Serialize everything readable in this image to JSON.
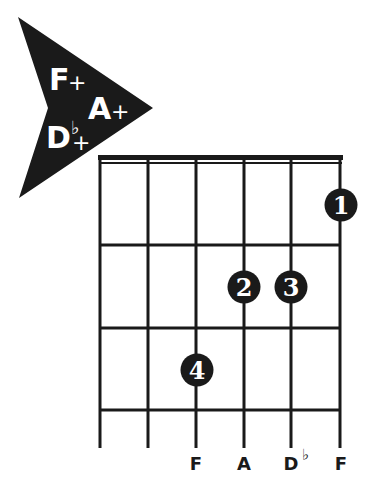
{
  "chord_badge": {
    "shape": "arrow-pointing-right",
    "color": "#1a1a1a",
    "names": [
      {
        "root": "F",
        "accidental": "",
        "quality": "+"
      },
      {
        "root": "A",
        "accidental": "",
        "quality": "+"
      },
      {
        "root": "D",
        "accidental": "♭",
        "quality": "+"
      }
    ]
  },
  "fretboard": {
    "strings": 6,
    "frets_shown": 3,
    "nut": true,
    "line_color": "#1a1a1a",
    "string_labels": [
      "",
      "",
      "F",
      "A",
      "D♭",
      "F"
    ],
    "label_parts": [
      {
        "root": "",
        "accidental": ""
      },
      {
        "root": "",
        "accidental": ""
      },
      {
        "root": "F",
        "accidental": ""
      },
      {
        "root": "A",
        "accidental": ""
      },
      {
        "root": "D",
        "accidental": "♭"
      },
      {
        "root": "F",
        "accidental": ""
      }
    ],
    "muted_strings": [
      1,
      2
    ]
  },
  "fingerings": [
    {
      "finger": "1",
      "string": 6,
      "fret": 1
    },
    {
      "finger": "2",
      "string": 4,
      "fret": 2
    },
    {
      "finger": "3",
      "string": 5,
      "fret": 2
    },
    {
      "finger": "4",
      "string": 3,
      "fret": 3
    }
  ]
}
